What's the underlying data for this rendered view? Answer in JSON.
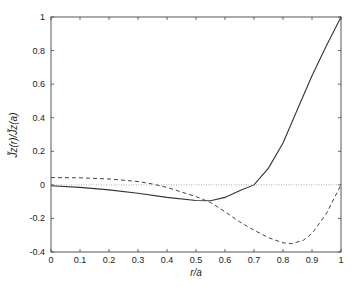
{
  "chart_data": {
    "type": "line",
    "title": "",
    "xlabel": "r/a",
    "ylabel": "J̃z(r)/J̃z(a)",
    "xlim": [
      0,
      1
    ],
    "ylim": [
      -0.4,
      1
    ],
    "xticks": [
      "0",
      "0.1",
      "0.2",
      "0.3",
      "0.4",
      "0.5",
      "0.6",
      "0.7",
      "0.8",
      "0.9",
      "1"
    ],
    "yticks": [
      "1",
      "0.8",
      "0.6",
      "0.4",
      "0.2",
      "0",
      "-0.2",
      "-0.4"
    ],
    "grid": false,
    "reference_line": {
      "y": 0,
      "style": "dotted"
    },
    "series": [
      {
        "name": "solid",
        "style": "solid",
        "x": [
          0,
          0.1,
          0.2,
          0.3,
          0.4,
          0.5,
          0.55,
          0.6,
          0.65,
          0.7,
          0.75,
          0.8,
          0.85,
          0.9,
          0.95,
          1.0
        ],
        "values": [
          -0.005,
          -0.015,
          -0.03,
          -0.05,
          -0.075,
          -0.093,
          -0.095,
          -0.075,
          -0.035,
          0.0,
          0.1,
          0.25,
          0.45,
          0.65,
          0.83,
          1.0
        ]
      },
      {
        "name": "dashed",
        "style": "dashed",
        "x": [
          0,
          0.1,
          0.2,
          0.3,
          0.35,
          0.4,
          0.5,
          0.55,
          0.6,
          0.65,
          0.7,
          0.75,
          0.8,
          0.83,
          0.87,
          0.9,
          0.95,
          1.0
        ],
        "values": [
          0.043,
          0.042,
          0.035,
          0.02,
          0.005,
          -0.015,
          -0.07,
          -0.105,
          -0.16,
          -0.22,
          -0.27,
          -0.315,
          -0.345,
          -0.35,
          -0.33,
          -0.29,
          -0.17,
          0.0
        ]
      }
    ]
  }
}
